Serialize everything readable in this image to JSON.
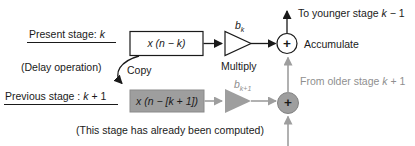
{
  "stage_panel": {
    "present_stage": {
      "prefix": "Present stage: ",
      "var": "k",
      "suffix": ""
    },
    "delay_note": "(Delay operation)",
    "previous_stage": {
      "prefix": "Previous stage : ",
      "var": "k",
      "suffix": " + 1"
    },
    "computed_note": "(This stage has already been computed)"
  },
  "present_path": {
    "delay_box": "x (n − k)",
    "gain": {
      "base": "b",
      "sub": "k"
    },
    "multiply": "Multiply",
    "adder_plus": "+",
    "accumulate": "Accumulate",
    "to_younger": {
      "prefix": "To younger stage ",
      "var": "k",
      "suffix": " − 1"
    }
  },
  "previous_path": {
    "delay_box": "x (n − [k + 1])",
    "gain": {
      "base": "b",
      "sub": "k+1"
    },
    "adder_plus": "+",
    "from_older": {
      "prefix": "From older stage ",
      "var": "k",
      "suffix": " + 1"
    },
    "copy": "Copy"
  },
  "colors": {
    "active": "#1a1a1a",
    "computed": "#9e9e9e",
    "computed_text": "#8f8f8f",
    "background": "#ffffff"
  }
}
